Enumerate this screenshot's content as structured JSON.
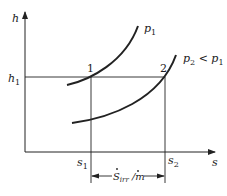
{
  "diagram": {
    "axes": {
      "y_label": "h",
      "x_label": "s"
    },
    "labels": {
      "h1": "h",
      "h1_sub": "1",
      "s1": "s",
      "s1_sub": "1",
      "s2": "s",
      "s2_sub": "2",
      "point1": "1",
      "point2": "2"
    },
    "curves": [
      {
        "name": "p1",
        "label": "p",
        "label_sub": "1",
        "label_suffix": ""
      },
      {
        "name": "p2",
        "label": "p",
        "label_sub": "2",
        "label_suffix": " < p",
        "label_suffix_sub": "1"
      }
    ],
    "dimension": {
      "label": "S",
      "label_sub": "irr",
      "label_divider": " /",
      "label_denominator": "m"
    },
    "colors": {
      "line": "#222222",
      "background": "#ffffff"
    }
  }
}
